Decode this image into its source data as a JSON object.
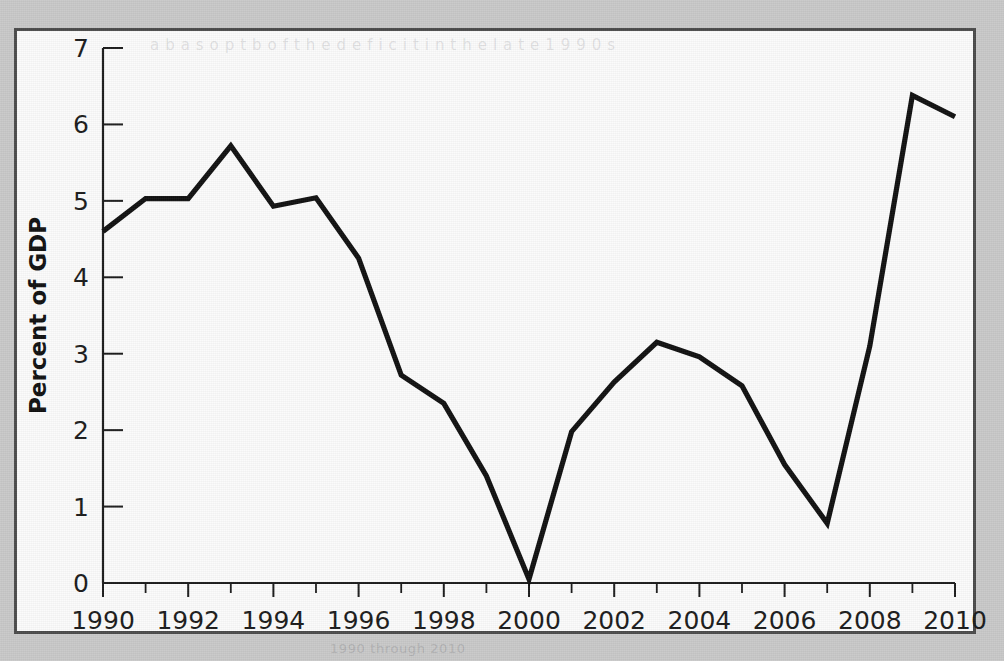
{
  "figure": {
    "bleed_through_top": "a b  a s  o p t  b  o f  t h e  d e f i c i t  i n  t h e  l a t e  1 9 9 0 s",
    "bleed_through_bottom": "1990 through 2010"
  },
  "chart_data": {
    "type": "line",
    "title": "",
    "xlabel": "",
    "ylabel": "Percent of GDP",
    "xlim": [
      1990,
      2010
    ],
    "ylim": [
      0,
      7
    ],
    "grid": false,
    "legend": "none",
    "y_ticks": [
      0,
      1,
      2,
      3,
      4,
      5,
      6,
      7
    ],
    "y_tick_labels": [
      "0",
      "1",
      "2",
      "3",
      "4",
      "5",
      "6",
      "7"
    ],
    "x_ticks": [
      1990,
      1992,
      1994,
      1996,
      1998,
      2000,
      2002,
      2004,
      2006,
      2008,
      2010
    ],
    "x_tick_labels": [
      "1990",
      "1992",
      "1994",
      "1996",
      "1998",
      "2000",
      "2002",
      "2004",
      "2006",
      "2008",
      "2010"
    ],
    "x_minor_ticks": [
      1991,
      1993,
      1995,
      1997,
      1999,
      2001,
      2003,
      2005,
      2007,
      2009
    ],
    "x": [
      1990,
      1991,
      1992,
      1993,
      1994,
      1995,
      1996,
      1997,
      1998,
      1999,
      2000,
      2001,
      2002,
      2003,
      2004,
      2005,
      2006,
      2007,
      2008,
      2009,
      2010
    ],
    "values": [
      4.6,
      5.03,
      5.03,
      5.72,
      4.93,
      5.04,
      4.25,
      2.72,
      2.35,
      1.4,
      0.05,
      1.98,
      2.63,
      3.15,
      2.96,
      2.58,
      1.55,
      0.78,
      3.1,
      6.38,
      6.1
    ],
    "series": [
      {
        "name": "Percent of GDP",
        "color": "#111111",
        "values": [
          4.6,
          5.03,
          5.03,
          5.72,
          4.93,
          5.04,
          4.25,
          2.72,
          2.35,
          1.4,
          0.05,
          1.98,
          2.63,
          3.15,
          2.96,
          2.58,
          1.55,
          0.78,
          3.1,
          6.38,
          6.1
        ]
      }
    ]
  }
}
